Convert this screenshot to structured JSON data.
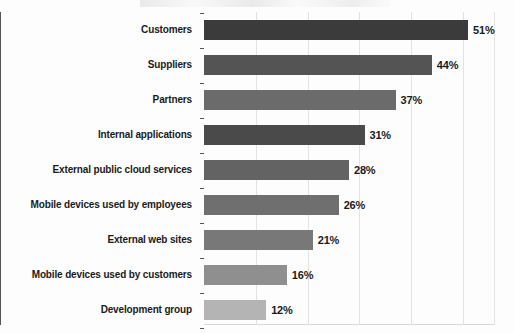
{
  "chart_data": {
    "type": "bar",
    "orientation": "horizontal",
    "title": "",
    "subtitle": "",
    "xlabel": "",
    "ylabel": "",
    "xlim": [
      0,
      56
    ],
    "grid": true,
    "grid_axis": "x",
    "legend": false,
    "value_suffix": "%",
    "categories": [
      "Customers",
      "Suppliers",
      "Partners",
      "Internal applications",
      "External public cloud services",
      "Mobile devices used by employees",
      "External web sites",
      "Mobile devices used by customers",
      "Development group"
    ],
    "values": [
      51,
      44,
      37,
      31,
      28,
      26,
      21,
      16,
      12
    ],
    "value_labels": [
      "51%",
      "44%",
      "37%",
      "31%",
      "28%",
      "26%",
      "21%",
      "16%",
      "12%"
    ],
    "bar_colors": [
      "#3b3b3b",
      "#545454",
      "#6b6b6b",
      "#4a4a4a",
      "#636363",
      "#6f6f6f",
      "#787878",
      "#8f8f8f",
      "#b4b4b4"
    ],
    "axis_color": "#555555",
    "grid_color": "#e3e3e3",
    "text_color": "#1b1b1b",
    "background": "#ffffff",
    "gridline_values": [
      10,
      20,
      30,
      40,
      50,
      56
    ]
  }
}
